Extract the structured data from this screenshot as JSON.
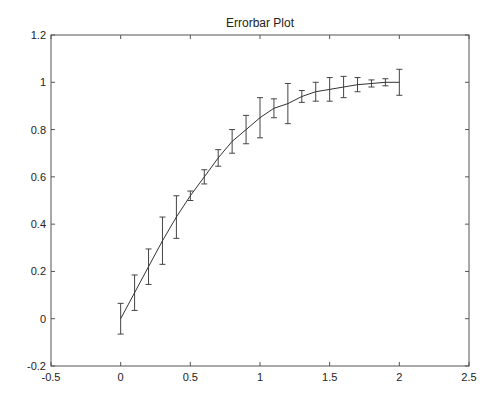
{
  "chart_data": {
    "type": "line",
    "subtype": "errorbar",
    "title": "Errorbar Plot",
    "xlabel": "",
    "ylabel": "",
    "xlim": [
      -0.5,
      2.5
    ],
    "ylim": [
      -0.2,
      1.2
    ],
    "xticks": [
      -0.5,
      0,
      0.5,
      1,
      1.5,
      2,
      2.5
    ],
    "xtick_labels": [
      "-0.5",
      "0",
      "0.5",
      "1",
      "1.5",
      "2",
      "2.5"
    ],
    "yticks": [
      -0.2,
      0,
      0.2,
      0.4,
      0.6,
      0.8,
      1,
      1.2
    ],
    "ytick_labels": [
      "-0.2",
      "0",
      "0.2",
      "0.4",
      "0.6",
      "0.8",
      "1",
      "1.2"
    ],
    "grid": false,
    "legend": null,
    "series": [
      {
        "name": "data",
        "color": "#333333",
        "x": [
          0,
          0.1,
          0.2,
          0.3,
          0.4,
          0.5,
          0.6,
          0.7,
          0.8,
          0.9,
          1.0,
          1.1,
          1.2,
          1.3,
          1.4,
          1.5,
          1.6,
          1.7,
          1.8,
          1.9,
          2.0
        ],
        "y": [
          0.0,
          0.11,
          0.22,
          0.33,
          0.43,
          0.52,
          0.6,
          0.68,
          0.75,
          0.8,
          0.85,
          0.89,
          0.91,
          0.94,
          0.96,
          0.97,
          0.98,
          0.99,
          0.995,
          1.0,
          1.0
        ],
        "error": [
          0.065,
          0.075,
          0.075,
          0.1,
          0.09,
          0.02,
          0.03,
          0.035,
          0.05,
          0.06,
          0.085,
          0.04,
          0.085,
          0.025,
          0.04,
          0.05,
          0.045,
          0.03,
          0.015,
          0.015,
          0.055
        ]
      }
    ]
  },
  "axes": {
    "title": "Errorbar Plot"
  }
}
